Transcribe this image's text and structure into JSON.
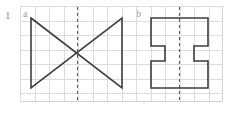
{
  "page": {
    "background_color": "#ffffff",
    "width": 229,
    "height": 114
  },
  "problem": {
    "number": "1"
  },
  "grid": {
    "line_color": "#dcdce0",
    "border_color": "#d2d2d6",
    "cell_size": 14.5,
    "left": 20,
    "top": 6,
    "right": 222,
    "bottom": 101,
    "cols": 14,
    "rows": 6.5
  },
  "figures": [
    {
      "id": "figure-a",
      "label": "a",
      "label_x": 23,
      "label_y": 9,
      "shape_name": "bowtie-hourglass",
      "stroke_color": "#3c3c42",
      "stroke_width": 1.6,
      "outline_points": "31,18 122,88 122,18 31,88 31,18",
      "symmetry_axis": {
        "type": "vertical-dashed",
        "x": 77,
        "y_top": 7,
        "y_bottom": 100,
        "color": "#55555c",
        "dash": "3,3"
      }
    },
    {
      "id": "figure-b",
      "label": "b",
      "label_x": 136,
      "label_y": 9,
      "shape_name": "i-beam-notched-rectangle",
      "stroke_color": "#3c3c42",
      "stroke_width": 1.6,
      "outline_points": "151,18 208,18 208,46 194,46 194,61 208,61 208,88 151,88 151,61 165,61 165,46 151,46 151,18",
      "symmetry_axis": {
        "type": "vertical-dashed",
        "x": 179.5,
        "y_top": 7,
        "y_bottom": 100,
        "color": "#55555c",
        "dash": "3,3"
      }
    }
  ]
}
